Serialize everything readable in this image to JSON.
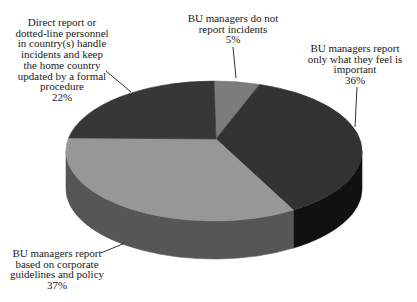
{
  "background": "#ffffff",
  "text_color": "#1a1a1a",
  "line_color": "#333333",
  "chart_data": {
    "type": "pie",
    "projection": "3d",
    "direction": "clockwise",
    "start_angle_deg": 0,
    "legend": false,
    "title": "",
    "slices": [
      {
        "label": "BU managers do not report incidents",
        "value_pct": 5,
        "color": "#7c7c7c",
        "side_color": "#4a4a4a"
      },
      {
        "label": "BU managers report only what they feel is important",
        "value_pct": 36,
        "color": "#323232",
        "side_color": "#111111"
      },
      {
        "label": "BU managers report based on corporate guidelines and policy",
        "value_pct": 37,
        "color": "#979797",
        "side_color": "#565656"
      },
      {
        "label": "Direct report or dotted-line personnel in country(s) handle incidents and keep the home country updated by a formal procedure",
        "value_pct": 22,
        "color": "#373737",
        "side_color": "#1a1a1a"
      }
    ]
  },
  "callouts": {
    "no_report": {
      "text": "BU managers do not\nreport incidents\n5%"
    },
    "feel_important": {
      "text": "BU managers report\nonly what they feel is\nimportant\n36%"
    },
    "guidelines": {
      "text": "BU managers report\nbased on corporate\nguidelines and policy\n37%"
    },
    "direct_report": {
      "text": "Direct report or\ndotted-line personnel\nin country(s) handle\nincidents and keep\nthe home country\nupdated by a formal\nprocedure\n22%"
    }
  }
}
